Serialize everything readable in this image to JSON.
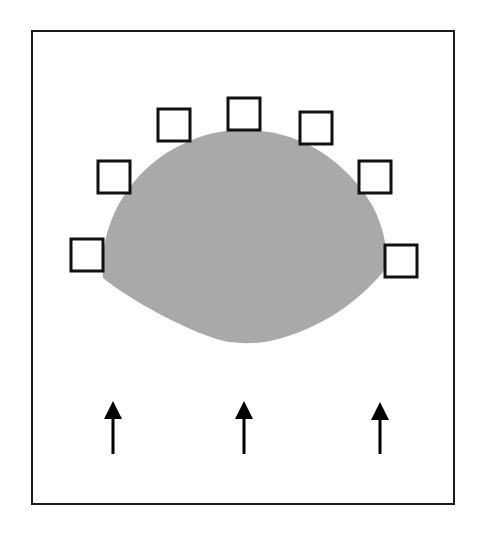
{
  "diagram": {
    "colors": {
      "background": "#ffffff",
      "frame": "#1a1a1a",
      "blob_fill": "#a9a9a9",
      "square_stroke": "#111111",
      "square_fill": "#ffffff",
      "arrow": "#000000"
    },
    "frame": {
      "x": 32,
      "y": 31,
      "width": 422,
      "height": 473
    },
    "blob": {
      "path": "M 103 278 C 98 230, 125 175, 175 148 C 205 132, 225 130, 245 130 C 300 130, 345 160, 372 205 C 388 235, 388 260, 383 272 C 360 300, 320 330, 270 341 C 255 344, 235 344, 220 340 C 185 330, 130 300, 103 278 Z"
    },
    "squares": [
      {
        "x": 71,
        "y": 239,
        "size": 32
      },
      {
        "x": 98,
        "y": 161,
        "size": 32
      },
      {
        "x": 158,
        "y": 109,
        "size": 32
      },
      {
        "x": 228,
        "y": 98,
        "size": 32
      },
      {
        "x": 300,
        "y": 112,
        "size": 32
      },
      {
        "x": 359,
        "y": 161,
        "size": 32
      },
      {
        "x": 385,
        "y": 245,
        "size": 32
      }
    ],
    "arrows": [
      {
        "x": 113,
        "tip_y": 401,
        "tail_y": 454
      },
      {
        "x": 244,
        "tip_y": 401,
        "tail_y": 454
      },
      {
        "x": 380,
        "tip_y": 402,
        "tail_y": 454
      }
    ]
  }
}
